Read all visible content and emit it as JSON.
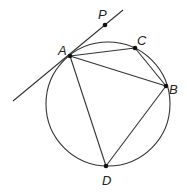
{
  "diagram": {
    "circle": {
      "cx": 108,
      "cy": 104,
      "r": 62
    },
    "points": {
      "A": {
        "label": "A",
        "x": 70,
        "y": 56,
        "lx": 58,
        "ly": 55
      },
      "B": {
        "label": "B",
        "x": 166,
        "y": 86,
        "lx": 169,
        "ly": 94
      },
      "C": {
        "label": "C",
        "x": 135,
        "y": 48,
        "lx": 137,
        "ly": 45
      },
      "D": {
        "label": "D",
        "x": 106,
        "y": 166,
        "lx": 102,
        "ly": 185
      },
      "P": {
        "label": "P",
        "x": 105,
        "y": 25,
        "lx": 98,
        "ly": 19
      }
    },
    "tangent_line": {
      "x1": 13,
      "y1": 101,
      "x2": 123,
      "y2": 10
    },
    "segments": [
      "AC",
      "CB",
      "AB",
      "AD",
      "BD"
    ]
  }
}
